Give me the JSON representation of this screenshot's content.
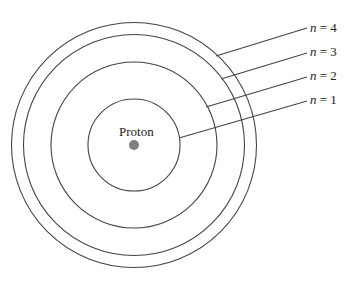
{
  "diagram": {
    "center_label": "Proton",
    "orbits": [
      {
        "n_symbol": "n",
        "eq": " = ",
        "value": "1",
        "label": "n = 1"
      },
      {
        "n_symbol": "n",
        "eq": " = ",
        "value": "2",
        "label": "n = 2"
      },
      {
        "n_symbol": "n",
        "eq": " = ",
        "value": "3",
        "label": "n = 3"
      },
      {
        "n_symbol": "n",
        "eq": " = ",
        "value": "4",
        "label": "n = 4"
      }
    ],
    "colors": {
      "line": "#444444",
      "proton": "#808080"
    }
  }
}
